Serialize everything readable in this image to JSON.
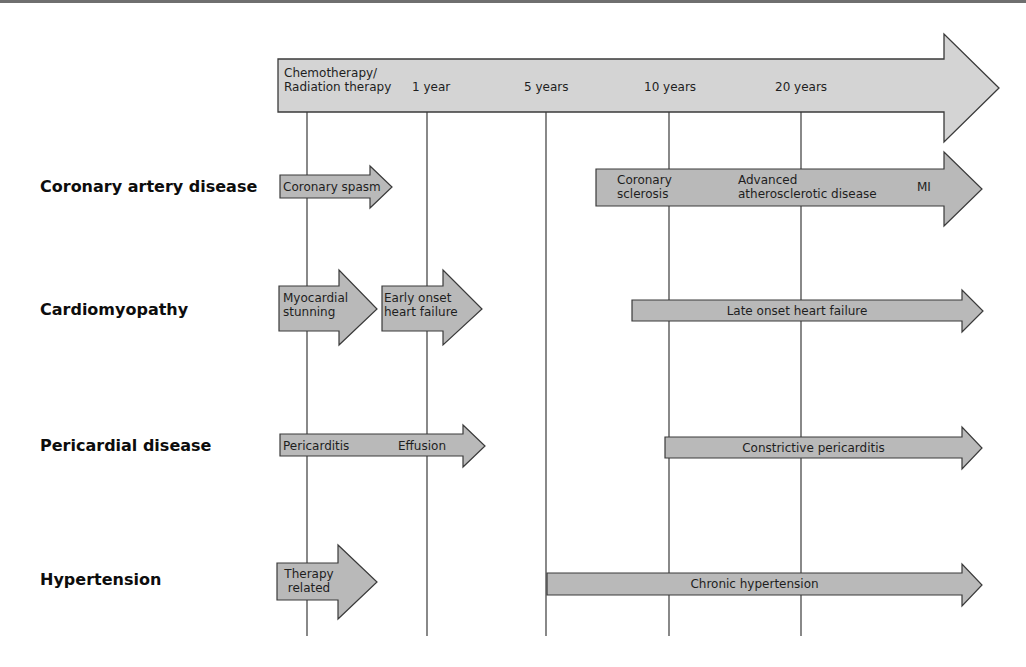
{
  "colors": {
    "timeline_fill": "#d4d4d4",
    "arrow_fill": "#b9b9b9",
    "stroke": "#3a3a3a",
    "background": "#ffffff"
  },
  "timeline": {
    "start_label": "Chemotherapy/\nRadiation therapy",
    "start_label_line1": "Chemotherapy/",
    "start_label_line2": "Radiation therapy",
    "ticks": [
      "1 year",
      "5 years",
      "10 years",
      "20 years"
    ]
  },
  "rows": [
    {
      "label": "Coronary artery disease",
      "arrows": [
        {
          "text": "Coronary spasm"
        },
        {
          "text_parts": [
            "Coronary\nsclerosis",
            "Advanced\natherosclerotic disease",
            "MI"
          ],
          "part1_line1": "Coronary",
          "part1_line2": "sclerosis",
          "part2_line1": "Advanced",
          "part2_line2": "atherosclerotic disease",
          "part3": "MI"
        }
      ]
    },
    {
      "label": "Cardiomyopathy",
      "arrows": [
        {
          "line1": "Myocardial",
          "line2": "stunning"
        },
        {
          "line1": "Early onset",
          "line2": "heart failure"
        },
        {
          "text": "Late onset heart failure"
        }
      ]
    },
    {
      "label": "Pericardial disease",
      "arrows": [
        {
          "text_left": "Pericarditis",
          "text_right": "Effusion"
        },
        {
          "text": "Constrictive pericarditis"
        }
      ]
    },
    {
      "label": "Hypertension",
      "arrows": [
        {
          "line1": "Therapy",
          "line2": "related"
        },
        {
          "text": "Chronic hypertension"
        }
      ]
    }
  ]
}
